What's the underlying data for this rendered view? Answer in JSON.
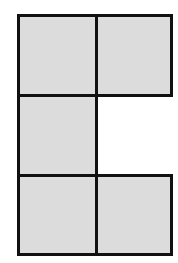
{
  "diagram": {
    "grid": {
      "columns": 2,
      "rows": 3
    },
    "fill_color": "#dcdcdc",
    "border_color": "#111111",
    "cells": [
      {
        "row": 0,
        "col": 0,
        "filled": true
      },
      {
        "row": 0,
        "col": 1,
        "filled": true
      },
      {
        "row": 1,
        "col": 0,
        "filled": true
      },
      {
        "row": 1,
        "col": 1,
        "filled": false
      },
      {
        "row": 2,
        "col": 0,
        "filled": true
      },
      {
        "row": 2,
        "col": 1,
        "filled": true
      }
    ]
  }
}
